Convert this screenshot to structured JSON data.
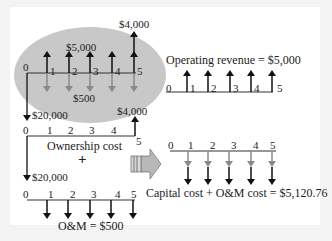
{
  "colors": {
    "background": "#f3f3f3",
    "panel": "#ffffff",
    "ellipse": "#c8c8c8",
    "arrow_black": "#111111",
    "arrow_gray": "#8a8a8a",
    "block_arrow": "#b5b5b5"
  },
  "combined_diagram": {
    "revenue_label": "$5,000",
    "om_label": "$500",
    "salvage_label": "$4,000",
    "capital_label": "$20,000",
    "periods": [
      "0",
      "1",
      "2",
      "3",
      "4",
      "5"
    ]
  },
  "ownership_diagram": {
    "title": "Ownership cost",
    "capital_label": "$20,000",
    "salvage_label": "$4,000",
    "periods": [
      "0",
      "1",
      "2",
      "3",
      "4",
      "5"
    ]
  },
  "plus_sign": "+",
  "om_diagram": {
    "title": "O&M = $500",
    "capital_label": "$20,000",
    "periods": [
      "0",
      "1",
      "2",
      "3",
      "4",
      "5"
    ]
  },
  "revenue_diagram": {
    "title": "Operating revenue = $5,000",
    "periods": [
      "0",
      "1",
      "2",
      "3",
      "4",
      "5"
    ]
  },
  "equivalent_diagram": {
    "title": "Capital cost + O&M cost = $5,120.76",
    "periods": [
      "0",
      "1",
      "2",
      "3",
      "4",
      "5"
    ]
  }
}
